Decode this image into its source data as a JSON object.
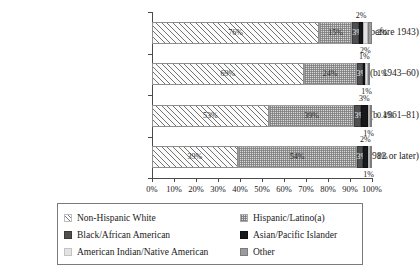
{
  "chart_data": {
    "type": "bar",
    "orientation": "horizontal",
    "stacked": true,
    "normalized": "100%",
    "title": "",
    "xlabel": "",
    "ylabel": "",
    "xlim": [
      0,
      100
    ],
    "grid": false,
    "legend_position": "bottom",
    "categories": [
      "Pre-Vatican II (b. before 1943)",
      "Vatican II (b. 1943–60)",
      "Post-Vatican II (b. 1961–81)",
      "Millennial (b. 1982 or later)"
    ],
    "xticks": [
      "0%",
      "10%",
      "20%",
      "30%",
      "40%",
      "50%",
      "60%",
      "70%",
      "80%",
      "90%",
      "100%"
    ],
    "xtick_values": [
      0,
      10,
      20,
      30,
      40,
      50,
      60,
      70,
      80,
      90,
      100
    ],
    "series": [
      {
        "name": "Non-Hispanic White",
        "fill": "diagonal-hatch",
        "color": "#fbfbfb",
        "values": [
          76,
          69,
          53,
          39
        ],
        "labels": [
          "76%",
          "69%",
          "53%",
          "39%"
        ],
        "label_placement": "inside"
      },
      {
        "name": "Hispanic/Latino(a)",
        "fill": "checkered-dot",
        "color": "#d9d9d9",
        "values": [
          15,
          24,
          39,
          54
        ],
        "labels": [
          "15%",
          "24%",
          "39%",
          "54%"
        ],
        "label_placement": "inside"
      },
      {
        "name": "Black/African American",
        "fill": "solid",
        "color": "#4f4f4f",
        "values": [
          3,
          3,
          3,
          3
        ],
        "labels": [
          "3%",
          "3%",
          "3%",
          "3%"
        ],
        "label_placement": "inside"
      },
      {
        "name": "Asian/Pacific Islander",
        "fill": "solid",
        "color": "#17181a",
        "values": [
          2,
          1,
          3,
          2
        ],
        "labels": [
          "2%",
          "1%",
          "3%",
          "2%"
        ],
        "label_placement": "above"
      },
      {
        "name": "American Indian/Native American",
        "fill": "solid",
        "color": "#e2e2e2",
        "values": [
          2,
          1,
          1,
          1
        ],
        "labels": [
          "2%",
          "1%",
          "1%",
          "1%"
        ],
        "label_placement": "below"
      },
      {
        "name": "Other",
        "fill": "solid",
        "color": "#9b9b9b",
        "values": [
          2,
          1,
          0.4,
          1
        ],
        "labels": [
          "2%",
          "1%",
          "0.4%",
          "1%"
        ],
        "label_placement": "right"
      }
    ]
  },
  "legend": {
    "entries": [
      {
        "label": "Non-Hispanic White",
        "swatch": "diagonal-hatch-swatch"
      },
      {
        "label": "Hispanic/Latino(a)",
        "swatch": "checkered-dot-swatch"
      },
      {
        "label": "Black/African American",
        "swatch": "dark-gray-swatch"
      },
      {
        "label": "Asian/Pacific Islander",
        "swatch": "near-black-swatch"
      },
      {
        "label": "American Indian/Native American",
        "swatch": "light-gray-swatch"
      },
      {
        "label": "Other",
        "swatch": "medium-gray-swatch"
      }
    ]
  }
}
